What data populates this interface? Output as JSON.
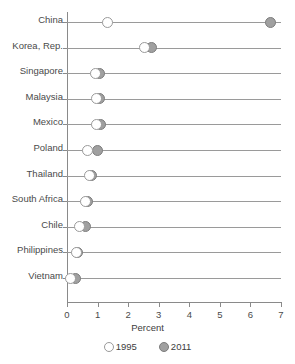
{
  "chart_data": {
    "type": "scatter",
    "subtype": "dumbbell",
    "title": "",
    "xlabel": "Percent",
    "ylabel": "",
    "xlim": [
      0,
      7
    ],
    "xticks": [
      0,
      1,
      2,
      3,
      4,
      5,
      6,
      7
    ],
    "xticklabels": [
      "0",
      "1",
      "2",
      "3",
      "4",
      "5",
      "6",
      "7"
    ],
    "grid": false,
    "legend_position": "bottom",
    "legend": [
      "1995",
      "2011"
    ],
    "categories": [
      "China",
      "Korea, Rep.",
      "Singapore",
      "Malaysia",
      "Mexico",
      "Poland",
      "Thailand",
      "South Africa",
      "Chile",
      "Philippines",
      "Vietnam"
    ],
    "series": [
      {
        "name": "1995",
        "marker": "open-circle",
        "color": "#ffffff",
        "edge_color": "#9a9a9a",
        "values": [
          1.33,
          2.55,
          0.94,
          0.95,
          0.95,
          0.68,
          0.72,
          0.62,
          0.42,
          0.3,
          0.1
        ]
      },
      {
        "name": "2011",
        "marker": "filled-circle",
        "color": "#a0a0a0",
        "edge_color": "#7d7d7d",
        "values": [
          6.65,
          2.78,
          1.07,
          1.07,
          1.1,
          1.0,
          0.8,
          0.68,
          0.61,
          0.35,
          0.28
        ]
      }
    ]
  },
  "axis": {
    "x_title": "Percent"
  },
  "legend": {
    "items": [
      {
        "label": "1995",
        "swatch": "open-circle-icon"
      },
      {
        "label": "2011",
        "swatch": "filled-circle-icon"
      }
    ]
  },
  "colors": {
    "marker_1995_fill": "#ffffff",
    "marker_1995_edge": "#9a9a9a",
    "marker_2011_fill": "#a0a0a0",
    "marker_2011_edge": "#7d7d7d",
    "axis": "#8a8a8a",
    "row_line": "#9a9a9a",
    "text": "#444444",
    "background": "#ffffff"
  }
}
